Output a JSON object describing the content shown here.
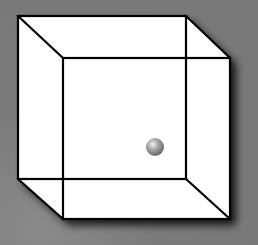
{
  "figure": {
    "background_color": "#7a7a7a",
    "face_color": "#ffffff",
    "edge_color": "#000000",
    "back_square": {
      "x1": 18,
      "y1": 16,
      "x2": 186,
      "y2": 179
    },
    "front_square": {
      "x1": 63,
      "y1": 58,
      "x2": 230,
      "y2": 219
    },
    "sphere": {
      "cx": 155,
      "cy": 147,
      "r": 9,
      "color": "#9a9a9a"
    }
  }
}
